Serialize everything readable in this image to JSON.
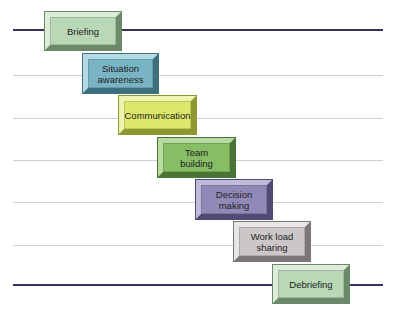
{
  "diagram": {
    "type": "staircase-process",
    "steps": [
      {
        "label": "Briefing",
        "color": "#b9d9b6",
        "light": "#dcecd8",
        "dark": "#6c8a69",
        "x": 45,
        "y": 12,
        "w": 76,
        "h": 38
      },
      {
        "label": "Situation awareness",
        "color": "#79b4c4",
        "light": "#b4dbe4",
        "dark": "#3d6f7d",
        "x": 83,
        "y": 54,
        "w": 75,
        "h": 39
      },
      {
        "label": "Communication",
        "color": "#dde86a",
        "light": "#eef3b0",
        "dark": "#8d9830",
        "x": 119,
        "y": 96,
        "w": 77,
        "h": 38
      },
      {
        "label": "Team building",
        "color": "#86bd65",
        "light": "#b8dba2",
        "dark": "#4a7335",
        "x": 158,
        "y": 138,
        "w": 77,
        "h": 39
      },
      {
        "label": "Decision making",
        "color": "#9189b8",
        "light": "#c1bbdb",
        "dark": "#514a75",
        "x": 196,
        "y": 180,
        "w": 76,
        "h": 39
      },
      {
        "label": "Work load sharing",
        "color": "#cbc7c7",
        "light": "#e8e5e5",
        "dark": "#7c7777",
        "x": 234,
        "y": 222,
        "w": 76,
        "h": 39
      },
      {
        "label": "Debriefing",
        "color": "#b9d9b6",
        "light": "#dcecd8",
        "dark": "#6c8a69",
        "x": 273,
        "y": 265,
        "w": 76,
        "h": 38
      }
    ],
    "lines": [
      {
        "y": 30,
        "major": true
      },
      {
        "y": 75,
        "major": false
      },
      {
        "y": 118,
        "major": false
      },
      {
        "y": 160,
        "major": false
      },
      {
        "y": 202,
        "major": false
      },
      {
        "y": 245,
        "major": false
      },
      {
        "y": 285,
        "major": true
      }
    ],
    "line_x_start": 13,
    "line_x_end": 383
  }
}
